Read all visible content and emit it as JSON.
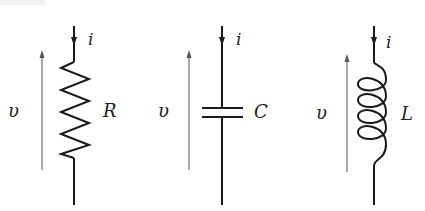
{
  "diagram": {
    "elements": [
      {
        "type": "resistor",
        "symbol_label": "R",
        "current_label": "i",
        "voltage_label": "υ"
      },
      {
        "type": "capacitor",
        "symbol_label": "C",
        "current_label": "i",
        "voltage_label": "υ"
      },
      {
        "type": "inductor",
        "symbol_label": "L",
        "current_label": "i",
        "voltage_label": "υ"
      }
    ]
  },
  "colors": {
    "wire": "#1a1a1a",
    "voltage_arrow": "#555555",
    "background": "#ffffff"
  }
}
